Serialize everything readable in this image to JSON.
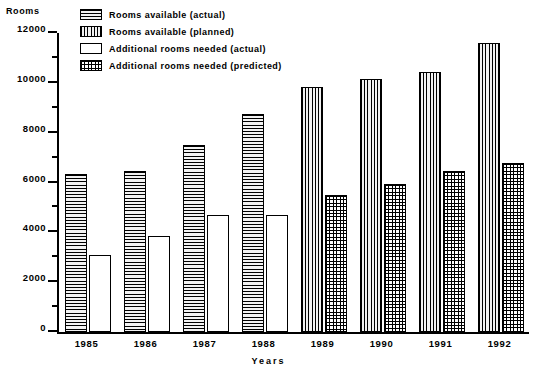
{
  "chart_data": {
    "type": "bar",
    "title": "",
    "ylabel": "Rooms",
    "xlabel": "Years",
    "categories": [
      "1985",
      "1986",
      "1987",
      "1988",
      "1989",
      "1990",
      "1991",
      "1992"
    ],
    "ylim": [
      0,
      12000
    ],
    "y_major_ticks": [
      0,
      2000,
      4000,
      6000,
      8000,
      10000,
      12000
    ],
    "y_tick_labels": [
      "0",
      "2000",
      "4000",
      "6000",
      "8000",
      "10000",
      "12000"
    ],
    "y_minor_tick_interval": 1000,
    "grid": false,
    "legend_position": "top-left",
    "series": [
      {
        "name": "Rooms available (actual)",
        "pattern": "horizontal-lines",
        "values": [
          6350,
          6450,
          7500,
          8750,
          null,
          null,
          null,
          null
        ]
      },
      {
        "name": "Rooms available (planned)",
        "pattern": "vertical-lines",
        "values": [
          null,
          null,
          null,
          null,
          9850,
          10150,
          10450,
          11600
        ]
      },
      {
        "name": "Additional rooms needed (actual)",
        "pattern": "checkered",
        "values": [
          3100,
          3850,
          4700,
          4700,
          null,
          null,
          null,
          null
        ]
      },
      {
        "name": "Additional rooms needed (predicted)",
        "pattern": "dotted",
        "values": [
          null,
          null,
          null,
          null,
          5500,
          5950,
          6450,
          6800
        ]
      }
    ]
  },
  "legend": {
    "items": [
      {
        "label": "Rooms available (actual)",
        "pattern": "horizontal-lines"
      },
      {
        "label": "Rooms available (planned)",
        "pattern": "vertical-lines"
      },
      {
        "label": "Additional rooms needed (actual)",
        "pattern": "checkered"
      },
      {
        "label": "Additional rooms needed (predicted)",
        "pattern": "dotted"
      }
    ]
  },
  "colors": {
    "ink": "#000000",
    "background": "#ffffff",
    "fill_light": "#f2f2f2"
  }
}
